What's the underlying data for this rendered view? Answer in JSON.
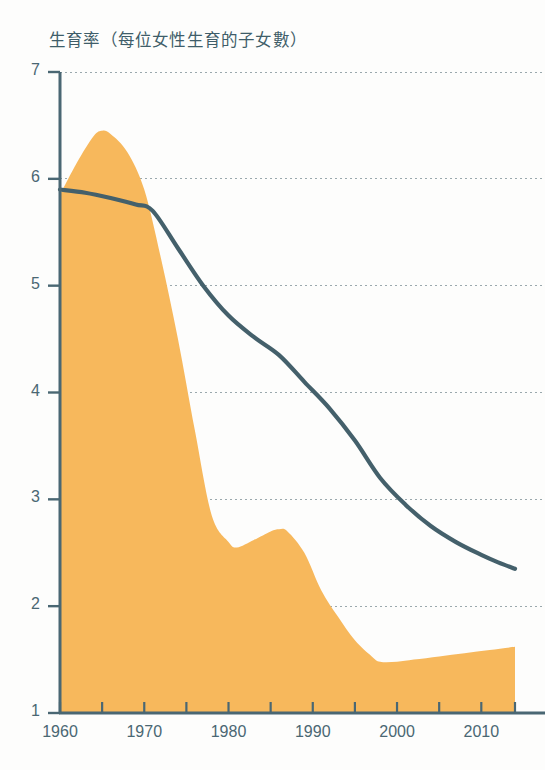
{
  "chart_data": {
    "type": "area",
    "title": "生育率（每位女性生育的子女數）",
    "xlabel": "",
    "ylabel": "",
    "xlim": [
      1960,
      2014
    ],
    "ylim": [
      1,
      7
    ],
    "grid": true,
    "legend": "none",
    "y_ticks": [
      7,
      6,
      5,
      4,
      3,
      2,
      1
    ],
    "x_ticks": [
      1960,
      1970,
      1980,
      1990,
      2000,
      2010
    ],
    "x_minor_ticks": [
      1965,
      1975,
      1985,
      1995,
      2005
    ],
    "colors": {
      "area_fill": "#f7b85c",
      "line": "#44606b",
      "axis": "#4a6773",
      "grid": "#9aa8ad",
      "title_text": "#3f5d69",
      "tick_text": "#4a6773",
      "background": "#fdfdfc"
    },
    "series": [
      {
        "name": "area-series",
        "render": "area",
        "color": "#f7b85c",
        "x": [
          1960,
          1962,
          1964,
          1965,
          1966,
          1968,
          1970,
          1972,
          1974,
          1976,
          1978,
          1980,
          1981,
          1983,
          1985,
          1986,
          1987,
          1989,
          1991,
          1993,
          1995,
          1997,
          1998,
          2000,
          2002,
          2005,
          2008,
          2011,
          2014
        ],
        "values": [
          5.85,
          6.15,
          6.4,
          6.45,
          6.42,
          6.25,
          5.9,
          5.25,
          4.5,
          3.65,
          2.85,
          2.6,
          2.55,
          2.62,
          2.7,
          2.72,
          2.7,
          2.5,
          2.15,
          1.9,
          1.68,
          1.53,
          1.48,
          1.48,
          1.5,
          1.53,
          1.56,
          1.59,
          1.62
        ]
      },
      {
        "name": "line-series",
        "render": "line",
        "color": "#44606b",
        "x": [
          1960,
          1963,
          1966,
          1969,
          1971,
          1974,
          1977,
          1980,
          1983,
          1986,
          1989,
          1992,
          1995,
          1998,
          2001,
          2004,
          2007,
          2010,
          2012,
          2014
        ],
        "values": [
          5.9,
          5.87,
          5.82,
          5.76,
          5.7,
          5.35,
          5.0,
          4.72,
          4.52,
          4.35,
          4.1,
          3.85,
          3.55,
          3.2,
          2.95,
          2.75,
          2.6,
          2.48,
          2.41,
          2.35
        ]
      }
    ]
  }
}
